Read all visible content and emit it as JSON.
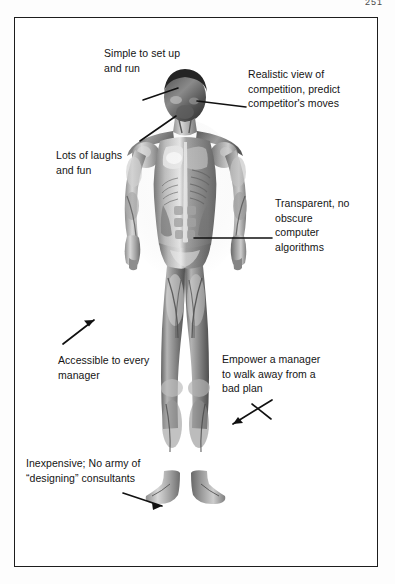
{
  "page": {
    "page_number": "251",
    "figure_border_color": "#1d1d1d",
    "background_color": "#ffffff",
    "text_color": "#141414"
  },
  "figure": {
    "callouts": [
      {
        "id": "simple",
        "text": "Simple to set up\nand run",
        "leader": "line-to-forehead",
        "target": "head"
      },
      {
        "id": "realistic",
        "text": "Realistic view of\ncompetition, predict\ncompetitor's moves",
        "leader": "line-to-face",
        "target": "face"
      },
      {
        "id": "laughs",
        "text": "Lots of laughs\nand fun",
        "leader": "line-to-jaw",
        "target": "jaw"
      },
      {
        "id": "transparent",
        "text": "Transparent, no\nobscure\ncomputer\nalgorithms",
        "leader": "line-to-abdomen",
        "target": "abdomen"
      },
      {
        "id": "accessible",
        "text": "Accessible to every\nmanager",
        "leader": "arrow-to-right-hand",
        "target": "hand"
      },
      {
        "id": "empower",
        "text": "Empower a manager\nto walk away from a\nbad plan",
        "leader": "arrow-to-left-knee",
        "target": "knee"
      },
      {
        "id": "inexpensive",
        "text": "Inexpensive; No army of\n“designing” consultants",
        "leader": "arrow-to-right-foot",
        "target": "foot"
      }
    ]
  }
}
